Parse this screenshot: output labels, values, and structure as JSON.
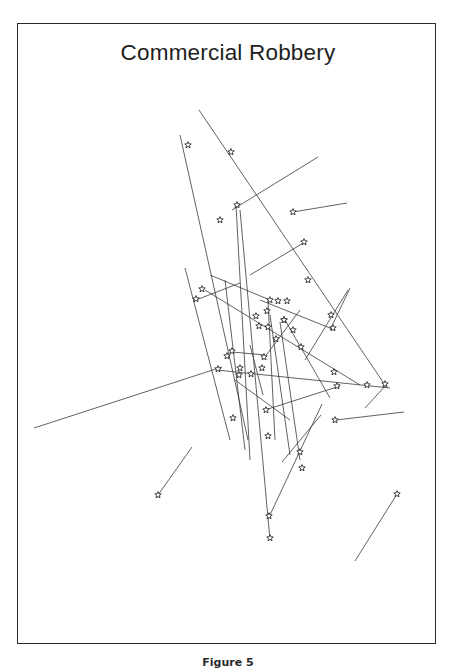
{
  "title": "Commercial Robbery",
  "caption": "Figure 5",
  "colors": {
    "line": "#3a3a3a",
    "star": "#2a2a2a",
    "frame": "#2a2a2a",
    "background": "#ffffff"
  },
  "marker": {
    "icon": "star-icon",
    "glyph": "☆"
  },
  "chart_data": {
    "type": "scatter",
    "title": "Commercial Robbery",
    "subtitle": "",
    "xlabel": "",
    "ylabel": "",
    "grid": false,
    "legend": null,
    "segments": [
      [
        180,
        135,
        248,
        440
      ],
      [
        199,
        110,
        385,
        385
      ],
      [
        232,
        210,
        318,
        157
      ],
      [
        293,
        212,
        347,
        203
      ],
      [
        250,
        275,
        305,
        242
      ],
      [
        185,
        268,
        230,
        440
      ],
      [
        240,
        210,
        270,
        540
      ],
      [
        236,
        205,
        250,
        460
      ],
      [
        225,
        280,
        245,
        450
      ],
      [
        205,
        290,
        360,
        385
      ],
      [
        210,
        275,
        270,
        300
      ],
      [
        196,
        300,
        240,
        283
      ],
      [
        34,
        428,
        222,
        367
      ],
      [
        158,
        495,
        192,
        447
      ],
      [
        355,
        561,
        397,
        494
      ],
      [
        270,
        515,
        322,
        404
      ],
      [
        282,
        462,
        321,
        415
      ],
      [
        336,
        420,
        404,
        412
      ],
      [
        217,
        370,
        390,
        388
      ],
      [
        265,
        410,
        340,
        386
      ],
      [
        305,
        360,
        348,
        290
      ],
      [
        330,
        330,
        350,
        288
      ],
      [
        264,
        358,
        300,
        310
      ],
      [
        285,
        320,
        330,
        398
      ],
      [
        268,
        300,
        275,
        440
      ],
      [
        270,
        315,
        290,
        455
      ],
      [
        280,
        322,
        300,
        460
      ],
      [
        232,
        352,
        265,
        355
      ],
      [
        260,
        300,
        335,
        330
      ],
      [
        365,
        408,
        388,
        383
      ],
      [
        235,
        380,
        290,
        420
      ],
      [
        250,
        345,
        263,
        395
      ]
    ],
    "stars": [
      [
        188,
        145
      ],
      [
        231,
        152
      ],
      [
        220,
        220
      ],
      [
        237,
        205
      ],
      [
        293,
        212
      ],
      [
        304,
        242
      ],
      [
        196,
        299
      ],
      [
        202,
        289
      ],
      [
        270,
        300
      ],
      [
        278,
        301
      ],
      [
        287,
        301
      ],
      [
        256,
        316
      ],
      [
        267,
        311
      ],
      [
        259,
        326
      ],
      [
        268,
        327
      ],
      [
        284,
        320
      ],
      [
        293,
        330
      ],
      [
        276,
        339
      ],
      [
        301,
        347
      ],
      [
        331,
        315
      ],
      [
        333,
        328
      ],
      [
        232,
        351
      ],
      [
        227,
        356
      ],
      [
        218,
        369
      ],
      [
        240,
        368
      ],
      [
        239,
        375
      ],
      [
        251,
        374
      ],
      [
        264,
        357
      ],
      [
        262,
        368
      ],
      [
        337,
        386
      ],
      [
        367,
        385
      ],
      [
        385,
        384
      ],
      [
        334,
        372
      ],
      [
        233,
        418
      ],
      [
        266,
        410
      ],
      [
        268,
        436
      ],
      [
        300,
        452
      ],
      [
        302,
        468
      ],
      [
        335,
        420
      ],
      [
        158,
        495
      ],
      [
        397,
        494
      ],
      [
        269,
        516
      ],
      [
        270,
        538
      ],
      [
        284,
        320
      ],
      [
        308,
        280
      ]
    ],
    "xlim": [
      17,
      436
    ],
    "ylim": [
      23,
      644
    ]
  }
}
